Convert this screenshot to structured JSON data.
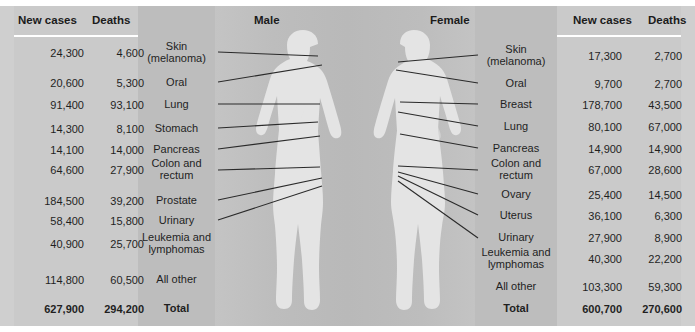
{
  "headers": {
    "male_title": "Male",
    "female_title": "Female",
    "left_new_cases": "New cases",
    "left_deaths": "Deaths",
    "right_new_cases": "New cases",
    "right_deaths": "Deaths"
  },
  "colors": {
    "background": "#c9c9c9",
    "label_band": "#bdbdbd",
    "number_band": "#cacaca",
    "silhouette": "#e3e3e3",
    "leader_line": "#2a2a2a",
    "text": "#1f1f1f"
  },
  "male": {
    "rows": [
      {
        "site": "Skin\n(melanoma)",
        "site_line1": "Skin",
        "site_line2": "(melanoma)",
        "new_cases": "24,300",
        "deaths": "4,600"
      },
      {
        "site": "Oral",
        "site_line1": "Oral",
        "site_line2": "",
        "new_cases": "20,600",
        "deaths": "5,300"
      },
      {
        "site": "Lung",
        "site_line1": "Lung",
        "site_line2": "",
        "new_cases": "91,400",
        "deaths": "93,100"
      },
      {
        "site": "Stomach",
        "site_line1": "Stomach",
        "site_line2": "",
        "new_cases": "14,300",
        "deaths": "8,100"
      },
      {
        "site": "Pancreas",
        "site_line1": "Pancreas",
        "site_line2": "",
        "new_cases": "14,100",
        "deaths": "14,000"
      },
      {
        "site": "Colon and rectum",
        "site_line1": "Colon and",
        "site_line2": "rectum",
        "new_cases": "64,600",
        "deaths": "27,900"
      },
      {
        "site": "Prostate",
        "site_line1": "Prostate",
        "site_line2": "",
        "new_cases": "184,500",
        "deaths": "39,200"
      },
      {
        "site": "Urinary",
        "site_line1": "Urinary",
        "site_line2": "",
        "new_cases": "58,400",
        "deaths": "15,800"
      },
      {
        "site": "Leukemia and lymphomas",
        "site_line1": "Leukemia and",
        "site_line2": "lymphomas",
        "new_cases": "40,900",
        "deaths": "25,700"
      },
      {
        "site": "All other",
        "site_line1": "All other",
        "site_line2": "",
        "new_cases": "114,800",
        "deaths": "60,500"
      }
    ],
    "total": {
      "label": "Total",
      "new_cases": "627,900",
      "deaths": "294,200"
    }
  },
  "female": {
    "rows": [
      {
        "site": "Skin\n(melanoma)",
        "site_line1": "Skin",
        "site_line2": "(melanoma)",
        "new_cases": "17,300",
        "deaths": "2,700"
      },
      {
        "site": "Oral",
        "site_line1": "Oral",
        "site_line2": "",
        "new_cases": "9,700",
        "deaths": "2,700"
      },
      {
        "site": "Breast",
        "site_line1": "Breast",
        "site_line2": "",
        "new_cases": "178,700",
        "deaths": "43,500"
      },
      {
        "site": "Lung",
        "site_line1": "Lung",
        "site_line2": "",
        "new_cases": "80,100",
        "deaths": "67,000"
      },
      {
        "site": "Pancreas",
        "site_line1": "Pancreas",
        "site_line2": "",
        "new_cases": "14,900",
        "deaths": "14,900"
      },
      {
        "site": "Colon and rectum",
        "site_line1": "Colon and",
        "site_line2": "rectum",
        "new_cases": "67,000",
        "deaths": "28,600"
      },
      {
        "site": "Ovary",
        "site_line1": "Ovary",
        "site_line2": "",
        "new_cases": "25,400",
        "deaths": "14,500"
      },
      {
        "site": "Uterus",
        "site_line1": "Uterus",
        "site_line2": "",
        "new_cases": "36,100",
        "deaths": "6,300"
      },
      {
        "site": "Urinary",
        "site_line1": "Urinary",
        "site_line2": "",
        "new_cases": "27,900",
        "deaths": "8,900"
      },
      {
        "site": "Leukemia and lymphomas",
        "site_line1": "Leukemia and",
        "site_line2": "lymphomas",
        "new_cases": "40,300",
        "deaths": "22,200"
      },
      {
        "site": "All other",
        "site_line1": "All other",
        "site_line2": "",
        "new_cases": "103,300",
        "deaths": "59,300"
      }
    ],
    "total": {
      "label": "Total",
      "new_cases": "600,700",
      "deaths": "270,600"
    }
  }
}
